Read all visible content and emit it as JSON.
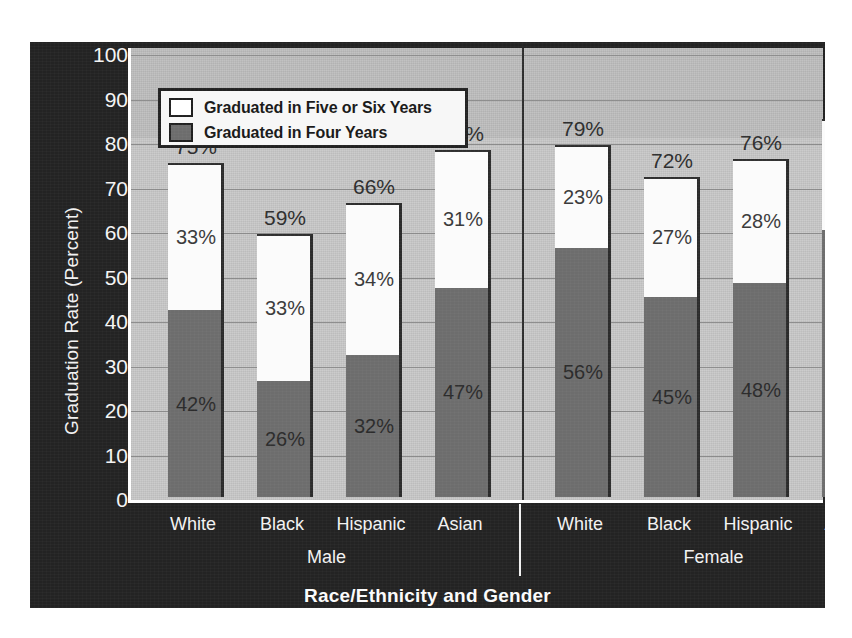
{
  "chart_data": {
    "type": "bar",
    "subtype": "stacked",
    "title": "",
    "xlabel": "Race/Ethnicity and Gender",
    "ylabel": "Graduation Rate (Percent)",
    "ylim": [
      0,
      100
    ],
    "ytick_labels": [
      "100",
      "90",
      "80",
      "70",
      "60",
      "50",
      "40",
      "30",
      "20",
      "10",
      "0"
    ],
    "ytick_values": [
      100,
      90,
      80,
      70,
      60,
      50,
      40,
      30,
      20,
      10,
      0
    ],
    "grid": true,
    "legend_position": "top-left inside",
    "categories": [
      "White",
      "Black",
      "Hispanic",
      "Asian",
      "White",
      "Black",
      "Hispanic",
      "Asian"
    ],
    "groups": [
      "Male",
      "Female"
    ],
    "series": [
      {
        "name": "Graduated in Four Years",
        "color": "#6d6d6d",
        "values": [
          42,
          26,
          32,
          47,
          56,
          45,
          48,
          60
        ],
        "value_labels": [
          "42%",
          "26%",
          "32%",
          "47%",
          "56%",
          "45%",
          "48%",
          "60%"
        ]
      },
      {
        "name": "Graduated in Five or Six Years",
        "color": "#fbfbfb",
        "values": [
          33,
          33,
          34,
          31,
          23,
          27,
          28,
          25
        ],
        "value_labels": [
          "33%",
          "33%",
          "34%",
          "31%",
          "23%",
          "27%",
          "28%",
          "25%"
        ]
      }
    ],
    "totals": [
      75,
      59,
      66,
      78,
      79,
      72,
      76,
      85
    ],
    "total_labels": [
      "75%",
      "59%",
      "66%",
      "78%",
      "79%",
      "72%",
      "76%",
      "85%"
    ],
    "bars": [
      {
        "group": "Male",
        "category": "White",
        "four": 42,
        "four_label": "42%",
        "five_six": 33,
        "five_six_label": "33%",
        "total_label": "75%"
      },
      {
        "group": "Male",
        "category": "Black",
        "four": 26,
        "four_label": "26%",
        "five_six": 33,
        "five_six_label": "33%",
        "total_label": "59%"
      },
      {
        "group": "Male",
        "category": "Hispanic",
        "four": 32,
        "four_label": "32%",
        "five_six": 34,
        "five_six_label": "34%",
        "total_label": "66%"
      },
      {
        "group": "Male",
        "category": "Asian",
        "four": 47,
        "four_label": "47%",
        "five_six": 31,
        "five_six_label": "31%",
        "total_label": "78%"
      },
      {
        "group": "Female",
        "category": "White",
        "four": 56,
        "four_label": "56%",
        "five_six": 23,
        "five_six_label": "23%",
        "total_label": "79%"
      },
      {
        "group": "Female",
        "category": "Black",
        "four": 45,
        "four_label": "45%",
        "five_six": 27,
        "five_six_label": "27%",
        "total_label": "72%"
      },
      {
        "group": "Female",
        "category": "Hispanic",
        "four": 48,
        "four_label": "48%",
        "five_six": 28,
        "five_six_label": "28%",
        "total_label": "76%"
      },
      {
        "group": "Female",
        "category": "Asian",
        "four": 60,
        "four_label": "60%",
        "five_six": 25,
        "five_six_label": "25%",
        "total_label": "85%"
      }
    ]
  },
  "legend": {
    "items": [
      {
        "label": "Graduated in Five or Six Years",
        "swatch": "white"
      },
      {
        "label": "Graduated in Four Years",
        "swatch": "gray"
      }
    ]
  },
  "axes": {
    "y_title": "Graduation Rate (Percent)",
    "x_title": "Race/Ethnicity and Gender",
    "y_ticks": [
      "100",
      "90",
      "80",
      "70",
      "60",
      "50",
      "40",
      "30",
      "20",
      "10",
      "0"
    ],
    "x_categories": [
      "White",
      "Black",
      "Hispanic",
      "Asian",
      "White",
      "Black",
      "Hispanic",
      "Asian"
    ],
    "x_groups": [
      "Male",
      "Female"
    ]
  },
  "colors": {
    "panel_background": "#232323",
    "plot_background": "#c9c9c9",
    "four_year_bar": "#6d6d6d",
    "five_six_year_bar": "#fbfbfb",
    "gridline": "#8b8b8b",
    "axis_text": "#f2f2f2",
    "legend_background": "#f7f7f7"
  }
}
